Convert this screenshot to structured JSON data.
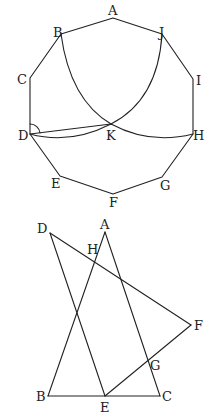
{
  "figures": [
    {
      "id": "decagon",
      "vertices": [
        "A",
        "B",
        "C",
        "D",
        "E",
        "F",
        "G",
        "H",
        "I",
        "J"
      ],
      "labels": {
        "A": "A",
        "B": "B",
        "C": "C",
        "D": "D",
        "E": "E",
        "F": "F",
        "G": "G",
        "H": "H",
        "I": "I",
        "J": "J",
        "K": "K"
      },
      "segments": [
        [
          "D",
          "K"
        ]
      ],
      "arcs": [
        {
          "from": "B",
          "to": "K",
          "via": "center-J"
        },
        {
          "from": "J",
          "to": "K",
          "via": "center-B"
        },
        {
          "from": "K",
          "to": "H",
          "via": "lower"
        },
        {
          "from": "D",
          "to": "K",
          "via": "lower"
        }
      ],
      "angle_mark": "D"
    },
    {
      "id": "triangles",
      "labels": {
        "A": "A",
        "B": "B",
        "C": "C",
        "D": "D",
        "E": "E",
        "F": "F",
        "G": "G",
        "H": "H"
      },
      "segments": [
        [
          "A",
          "B"
        ],
        [
          "A",
          "C"
        ],
        [
          "B",
          "C"
        ],
        [
          "D",
          "E"
        ],
        [
          "D",
          "F"
        ],
        [
          "E",
          "F"
        ]
      ]
    }
  ]
}
